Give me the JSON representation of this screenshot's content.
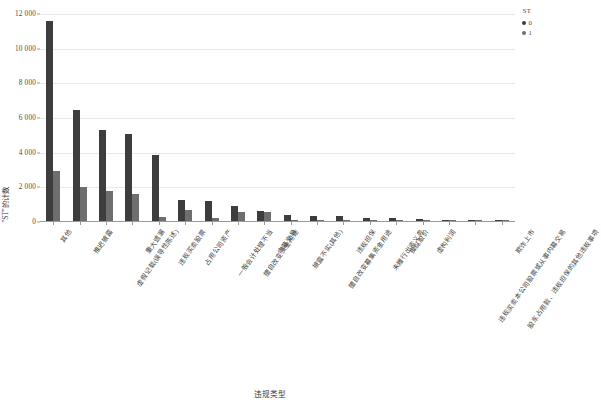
{
  "chart_data": {
    "type": "bar",
    "title": "",
    "xlabel": "违规类型",
    "ylabel": "\"ST\"的计数",
    "ylim": [
      0,
      12000
    ],
    "yticks": [
      0,
      2000,
      4000,
      6000,
      8000,
      10000,
      12000
    ],
    "ytick_labels": [
      "0",
      "2 000",
      "4 000",
      "6 000",
      "8 000",
      "10 000",
      "12 000"
    ],
    "grid": true,
    "legend_position": "top-right",
    "legend_title": "ST",
    "categories": [
      "其他",
      "推迟披露",
      "虚假记载(误导性陈述)",
      "重大遗漏",
      "违规买卖股票",
      "占用公司资产",
      "一般会计处理不当",
      "擅自改变资金用途",
      "内幕交易",
      "披露不实(其他)",
      "擅自改变募集资金用途",
      "违规担保",
      "未履行出资义务",
      "操纵股价",
      "虚构利润",
      "违规买卖本公司股票或从事内幕交易",
      "股东占用款、违规担保的其他违规事项",
      "欺诈上市"
    ],
    "series": [
      {
        "name": "0",
        "color": "#3d3d3d",
        "values": [
          11550,
          6420,
          5240,
          5020,
          3830,
          1230,
          1150,
          870,
          600,
          320,
          290,
          290,
          190,
          175,
          90,
          70,
          45,
          25
        ]
      },
      {
        "name": "1",
        "color": "#6e6e6e",
        "values": [
          2880,
          1980,
          1730,
          1540,
          250,
          610,
          185,
          500,
          545,
          60,
          35,
          40,
          60,
          55,
          30,
          25,
          20,
          10
        ]
      }
    ]
  },
  "legend": {
    "title": "ST",
    "items": [
      {
        "label": "0",
        "color": "#3d3d3d"
      },
      {
        "label": "1",
        "color": "#6e6e6e"
      }
    ]
  },
  "axes": {
    "y_title": "\"ST\"的计数",
    "x_title": "违规类型"
  }
}
